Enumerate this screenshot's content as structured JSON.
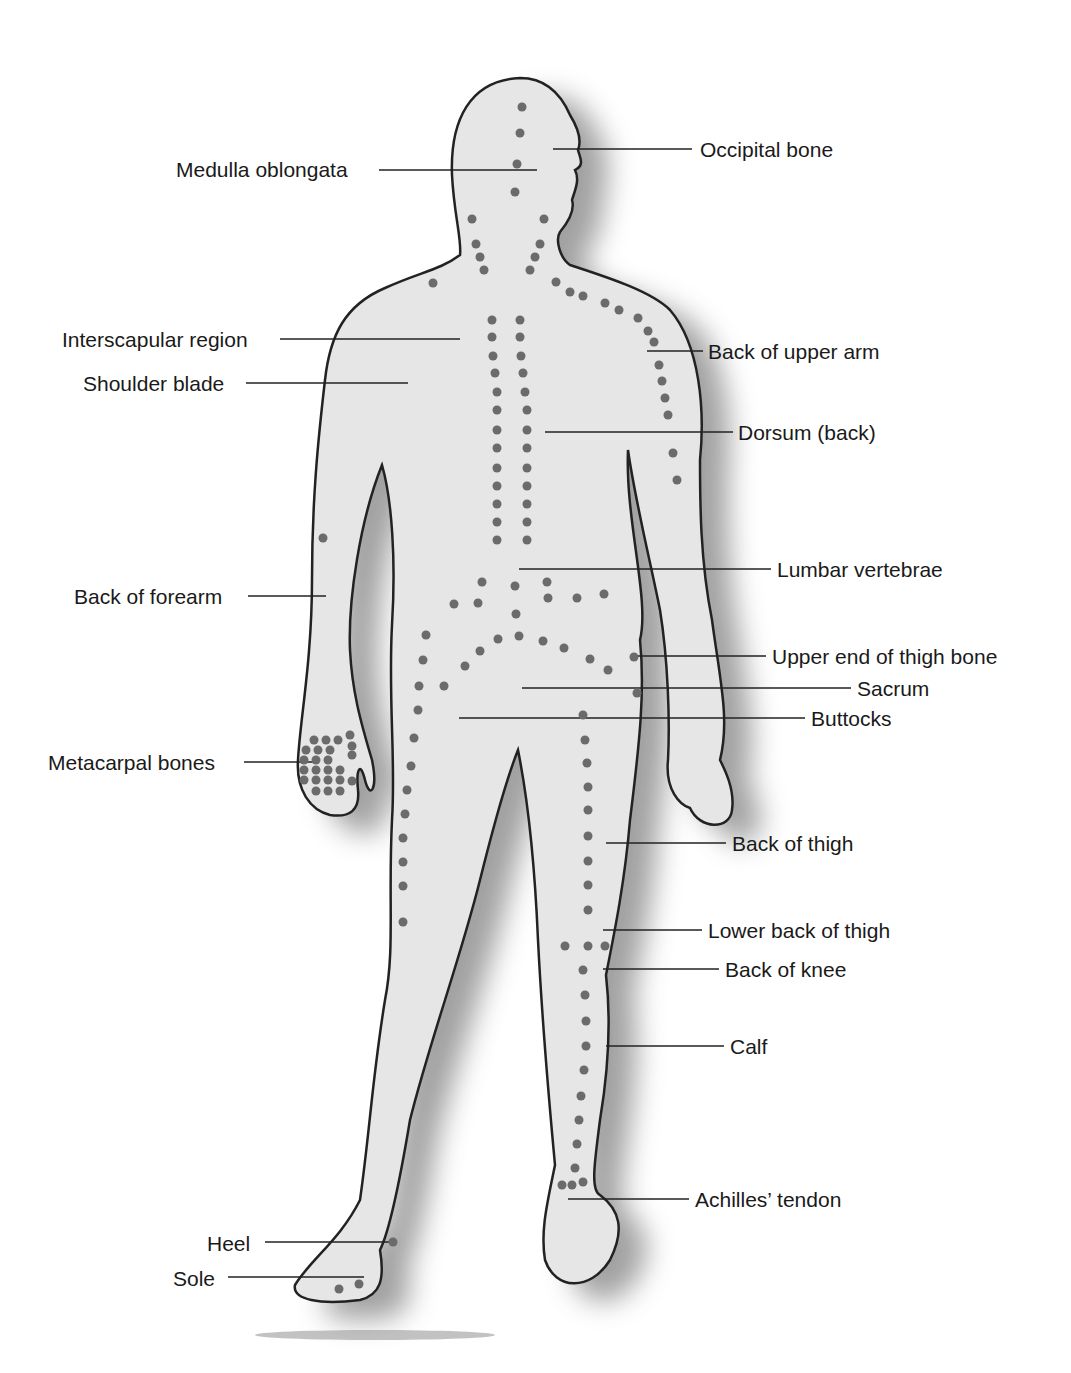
{
  "figure": {
    "colors": {
      "body_fill": "#e6e6e6",
      "outline": "#222222",
      "dot": "#6b6b6b",
      "leader": "#222222",
      "shadow": "#555555"
    }
  },
  "labels_left": [
    {
      "id": "medulla-oblongata",
      "text": "Medulla oblongata",
      "x": 176,
      "y": 158,
      "lx1": 379,
      "lx2": 537,
      "ly": 170
    },
    {
      "id": "interscapular-region",
      "text": "Interscapular region",
      "x": 62,
      "y": 328,
      "lx1": 280,
      "lx2": 460,
      "ly": 339
    },
    {
      "id": "shoulder-blade",
      "text": "Shoulder blade",
      "x": 83,
      "y": 372,
      "lx1": 246,
      "lx2": 408,
      "ly": 383
    },
    {
      "id": "back-of-forearm",
      "text": "Back of forearm",
      "x": 74,
      "y": 585,
      "lx1": 248,
      "lx2": 326,
      "ly": 596
    },
    {
      "id": "metacarpal-bones",
      "text": "Metacarpal bones",
      "x": 48,
      "y": 751,
      "lx1": 244,
      "lx2": 318,
      "ly": 762
    },
    {
      "id": "heel",
      "text": "Heel",
      "x": 207,
      "y": 1232,
      "lx1": 265,
      "lx2": 392,
      "ly": 1242
    },
    {
      "id": "sole",
      "text": "Sole",
      "x": 173,
      "y": 1267,
      "lx1": 228,
      "lx2": 364,
      "ly": 1277
    }
  ],
  "labels_right": [
    {
      "id": "occipital-bone",
      "text": "Occipital bone",
      "x": 700,
      "y": 138,
      "lx1": 553,
      "lx2": 692,
      "ly": 149
    },
    {
      "id": "back-of-upper-arm",
      "text": "Back of upper arm",
      "x": 708,
      "y": 340,
      "lx1": 647,
      "lx2": 703,
      "ly": 351
    },
    {
      "id": "dorsum-back",
      "text": "Dorsum (back)",
      "x": 738,
      "y": 421,
      "lx1": 545,
      "lx2": 733,
      "ly": 432
    },
    {
      "id": "lumbar-vertebrae",
      "text": "Lumbar vertebrae",
      "x": 777,
      "y": 558,
      "lx1": 519,
      "lx2": 771,
      "ly": 569
    },
    {
      "id": "upper-end-of-thigh-bone",
      "text": "Upper end of thigh bone",
      "x": 772,
      "y": 645,
      "lx1": 636,
      "lx2": 766,
      "ly": 656
    },
    {
      "id": "sacrum",
      "text": "Sacrum",
      "x": 857,
      "y": 677,
      "lx1": 522,
      "lx2": 851,
      "ly": 688
    },
    {
      "id": "buttocks",
      "text": "Buttocks",
      "x": 811,
      "y": 707,
      "lx1": 459,
      "lx2": 805,
      "ly": 718
    },
    {
      "id": "back-of-thigh",
      "text": "Back of thigh",
      "x": 732,
      "y": 832,
      "lx1": 606,
      "lx2": 726,
      "ly": 843
    },
    {
      "id": "lower-back-of-thigh",
      "text": "Lower back of thigh",
      "x": 708,
      "y": 919,
      "lx1": 603,
      "lx2": 702,
      "ly": 930
    },
    {
      "id": "back-of-knee",
      "text": "Back of knee",
      "x": 725,
      "y": 958,
      "lx1": 603,
      "lx2": 719,
      "ly": 969
    },
    {
      "id": "calf",
      "text": "Calf",
      "x": 730,
      "y": 1035,
      "lx1": 606,
      "lx2": 724,
      "ly": 1046
    },
    {
      "id": "achilles-tendon",
      "text": "Achilles’ tendon",
      "x": 695,
      "y": 1188,
      "lx1": 568,
      "lx2": 689,
      "ly": 1199
    }
  ],
  "dots": [
    [
      522,
      107
    ],
    [
      520,
      133
    ],
    [
      517,
      164
    ],
    [
      515,
      192
    ],
    [
      472,
      219
    ],
    [
      476,
      244
    ],
    [
      480,
      257
    ],
    [
      484,
      270
    ],
    [
      544,
      219
    ],
    [
      540,
      244
    ],
    [
      535,
      257
    ],
    [
      530,
      270
    ],
    [
      433,
      283
    ],
    [
      556,
      282
    ],
    [
      570,
      292
    ],
    [
      583,
      296
    ],
    [
      605,
      303
    ],
    [
      619,
      310
    ],
    [
      638,
      318
    ],
    [
      648,
      331
    ],
    [
      654,
      342
    ],
    [
      659,
      365
    ],
    [
      662,
      381
    ],
    [
      665,
      398
    ],
    [
      668,
      415
    ],
    [
      673,
      453
    ],
    [
      677,
      480
    ],
    [
      492,
      320
    ],
    [
      520,
      320
    ],
    [
      492,
      337
    ],
    [
      520,
      337
    ],
    [
      493,
      356
    ],
    [
      521,
      356
    ],
    [
      495,
      373
    ],
    [
      523,
      373
    ],
    [
      497,
      392
    ],
    [
      525,
      392
    ],
    [
      497,
      410
    ],
    [
      527,
      410
    ],
    [
      497,
      430
    ],
    [
      527,
      430
    ],
    [
      497,
      448
    ],
    [
      527,
      448
    ],
    [
      497,
      468
    ],
    [
      527,
      468
    ],
    [
      497,
      486
    ],
    [
      527,
      486
    ],
    [
      497,
      504
    ],
    [
      527,
      504
    ],
    [
      497,
      522
    ],
    [
      527,
      522
    ],
    [
      497,
      540
    ],
    [
      527,
      540
    ],
    [
      323,
      538
    ],
    [
      482,
      582
    ],
    [
      515,
      586
    ],
    [
      547,
      582
    ],
    [
      548,
      598
    ],
    [
      577,
      598
    ],
    [
      604,
      594
    ],
    [
      454,
      604
    ],
    [
      478,
      603
    ],
    [
      516,
      614
    ],
    [
      426,
      635
    ],
    [
      498,
      639
    ],
    [
      519,
      636
    ],
    [
      543,
      641
    ],
    [
      564,
      648
    ],
    [
      590,
      659
    ],
    [
      608,
      670
    ],
    [
      634,
      657
    ],
    [
      637,
      693
    ],
    [
      480,
      651
    ],
    [
      465,
      666
    ],
    [
      444,
      686
    ],
    [
      423,
      660
    ],
    [
      419,
      686
    ],
    [
      418,
      710
    ],
    [
      414,
      738
    ],
    [
      411,
      766
    ],
    [
      407,
      790
    ],
    [
      405,
      814
    ],
    [
      403,
      838
    ],
    [
      403,
      862
    ],
    [
      403,
      886
    ],
    [
      403,
      922
    ],
    [
      583,
      715
    ],
    [
      585,
      740
    ],
    [
      587,
      763
    ],
    [
      588,
      787
    ],
    [
      588,
      810
    ],
    [
      588,
      836
    ],
    [
      588,
      861
    ],
    [
      588,
      885
    ],
    [
      588,
      910
    ],
    [
      565,
      946
    ],
    [
      588,
      946
    ],
    [
      605,
      946
    ],
    [
      583,
      970
    ],
    [
      585,
      995
    ],
    [
      586,
      1021
    ],
    [
      586,
      1046
    ],
    [
      584,
      1070
    ],
    [
      581,
      1096
    ],
    [
      579,
      1120
    ],
    [
      577,
      1144
    ],
    [
      575,
      1168
    ],
    [
      562,
      1185
    ],
    [
      572,
      1185
    ],
    [
      583,
      1182
    ],
    [
      393,
      1242
    ],
    [
      339,
      1289
    ],
    [
      359,
      1284
    ],
    [
      314,
      740
    ],
    [
      326,
      740
    ],
    [
      338,
      740
    ],
    [
      350,
      735
    ],
    [
      306,
      750
    ],
    [
      318,
      750
    ],
    [
      330,
      750
    ],
    [
      352,
      746
    ],
    [
      304,
      760
    ],
    [
      316,
      760
    ],
    [
      328,
      760
    ],
    [
      352,
      755
    ],
    [
      304,
      770
    ],
    [
      316,
      770
    ],
    [
      328,
      770
    ],
    [
      340,
      770
    ],
    [
      304,
      780
    ],
    [
      316,
      780
    ],
    [
      328,
      780
    ],
    [
      340,
      780
    ],
    [
      316,
      791
    ],
    [
      328,
      791
    ],
    [
      340,
      791
    ],
    [
      352,
      781
    ]
  ]
}
